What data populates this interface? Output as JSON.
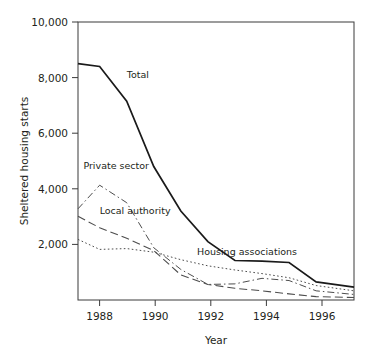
{
  "chart_data": {
    "type": "line",
    "title": "",
    "xlabel": "Year",
    "ylabel": "Sheltered housing starts",
    "xlim": [
      1987.2,
      1997.4
    ],
    "ylim": [
      0,
      10000
    ],
    "xticks": [
      1988,
      1990,
      1992,
      1994,
      1996
    ],
    "xtick_labels": [
      "1988",
      "1990",
      "1992",
      "1994",
      "1996"
    ],
    "yticks": [
      2000,
      4000,
      6000,
      8000,
      10000
    ],
    "ytick_labels": [
      "2,000",
      "4,000",
      "6,000",
      "8,000",
      "10,000"
    ],
    "grid": false,
    "legend_position": "inline-annotations",
    "series": [
      {
        "name": "Total",
        "style": "solid",
        "label": "Total",
        "label_x": 1989.0,
        "label_y": 8000,
        "x": [
          1987.2,
          1988,
          1989,
          1990,
          1991,
          1992,
          1993,
          1994,
          1995,
          1996,
          1997.4
        ],
        "values": [
          8500,
          8400,
          7150,
          4800,
          3200,
          2100,
          1420,
          1400,
          1350,
          650,
          460
        ]
      },
      {
        "name": "Private sector",
        "style": "dash-dot",
        "label": "Private sector",
        "label_x": 1987.4,
        "label_y": 4720,
        "x": [
          1987.2,
          1988,
          1989,
          1990,
          1991,
          1992,
          1993,
          1994,
          1995,
          1996,
          1997.4
        ],
        "values": [
          3280,
          4130,
          3500,
          1880,
          1100,
          560,
          580,
          780,
          700,
          330,
          200
        ]
      },
      {
        "name": "Local authority",
        "style": "long-dash",
        "label": "Local authority",
        "label_x": 1988.0,
        "label_y": 3080,
        "x": [
          1987.2,
          1988,
          1989,
          1990,
          1991,
          1992,
          1993,
          1994,
          1995,
          1996,
          1997.4
        ],
        "values": [
          3010,
          2600,
          2220,
          1780,
          900,
          560,
          420,
          330,
          220,
          120,
          90
        ]
      },
      {
        "name": "Housing associations",
        "style": "dotted",
        "label": "Housing associations",
        "label_x": 1991.6,
        "label_y": 1620,
        "x": [
          1987.2,
          1988,
          1989,
          1990,
          1991,
          1992,
          1993,
          1994,
          1995,
          1996,
          1997.4
        ],
        "values": [
          2180,
          1820,
          1850,
          1720,
          1450,
          1230,
          1080,
          950,
          800,
          520,
          330
        ]
      }
    ]
  },
  "axis": {
    "y_title": "Sheltered housing starts",
    "x_title": "Year"
  }
}
